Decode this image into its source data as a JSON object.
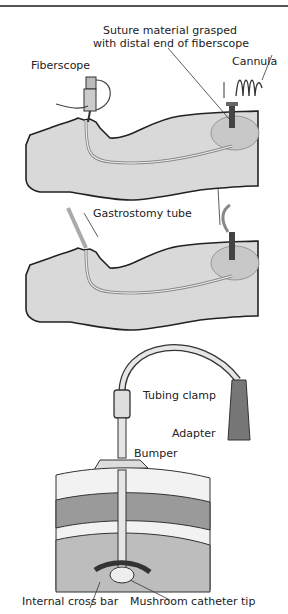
{
  "diagram": {
    "panels": [
      {
        "id": "panel-1",
        "labels": {
          "suture_line1": "Suture material grasped",
          "suture_line2": "with distal end of fiberscope",
          "fiberscope": "Fiberscope",
          "cannula": "Cannula"
        }
      },
      {
        "id": "panel-2",
        "labels": {
          "gastrostomy_tube": "Gastrostomy tube"
        }
      },
      {
        "id": "panel-3",
        "labels": {
          "tubing_clamp": "Tubing clamp",
          "adapter": "Adapter",
          "bumper": "Bumper",
          "internal_cross_bar": "Internal cross bar",
          "mushroom_catheter_tip": "Mushroom catheter tip"
        }
      }
    ],
    "colors": {
      "body_fill": "#d9d9d9",
      "outline": "#222222",
      "stomach_fill": "#c8c8c8",
      "fat_fill": "#f2f2f2",
      "muscle_fill": "#9a9a9a",
      "lumen_fill": "#bdbdbd"
    }
  }
}
